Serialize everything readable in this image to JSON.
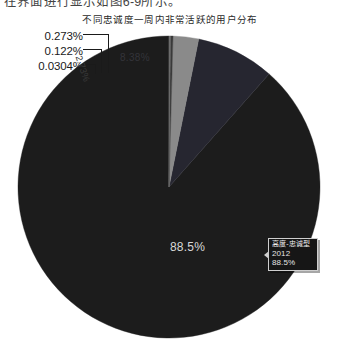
{
  "page": {
    "clipped_text": "在界面进行显示如图6-9所示。"
  },
  "chart_data": {
    "type": "pie",
    "title": "不同忠诚度一周内非常活跃的用户分布",
    "xlabel": "",
    "ylabel": "",
    "legend_position": "none",
    "grid": false,
    "categories": [
      "高度-忠诚型",
      "中度-忠诚型",
      "低度-忠诚型",
      "偶尔-活跃型",
      "新-注册型",
      "流失-风险型"
    ],
    "values": [
      88.5,
      8.38,
      2.73,
      0.273,
      0.122,
      0.0304
    ],
    "labels": [
      "88.5%",
      "8.38%",
      "2.73%",
      "0.273%",
      "0.122%",
      "0.0304%"
    ],
    "colors": [
      "#1c1c1c",
      "#262630",
      "#8a8a8a",
      "#3a3a3a",
      "#5a5a5a",
      "#6e6e6e"
    ],
    "start_angle_deg": 0,
    "direction": "counterclockwise"
  },
  "labels": {
    "callouts": [
      {
        "text": "0.273%"
      },
      {
        "text": "0.122%"
      },
      {
        "text": "0.0304%"
      }
    ],
    "inner": {
      "big": "88.5%",
      "second": "8.38%",
      "third": "2.73%"
    }
  },
  "tooltip": {
    "title": "高度-忠诚型",
    "value": "2012",
    "percent": "88.5%"
  },
  "colors": {
    "background": "#ffffff",
    "slice_main": "#1c1c1c",
    "slice_second": "#262630",
    "slice_third": "#8a8a8a",
    "leader_line": "#1a1a1a",
    "tooltip_bg": "#161616",
    "tooltip_border": "#cfcfcf"
  }
}
